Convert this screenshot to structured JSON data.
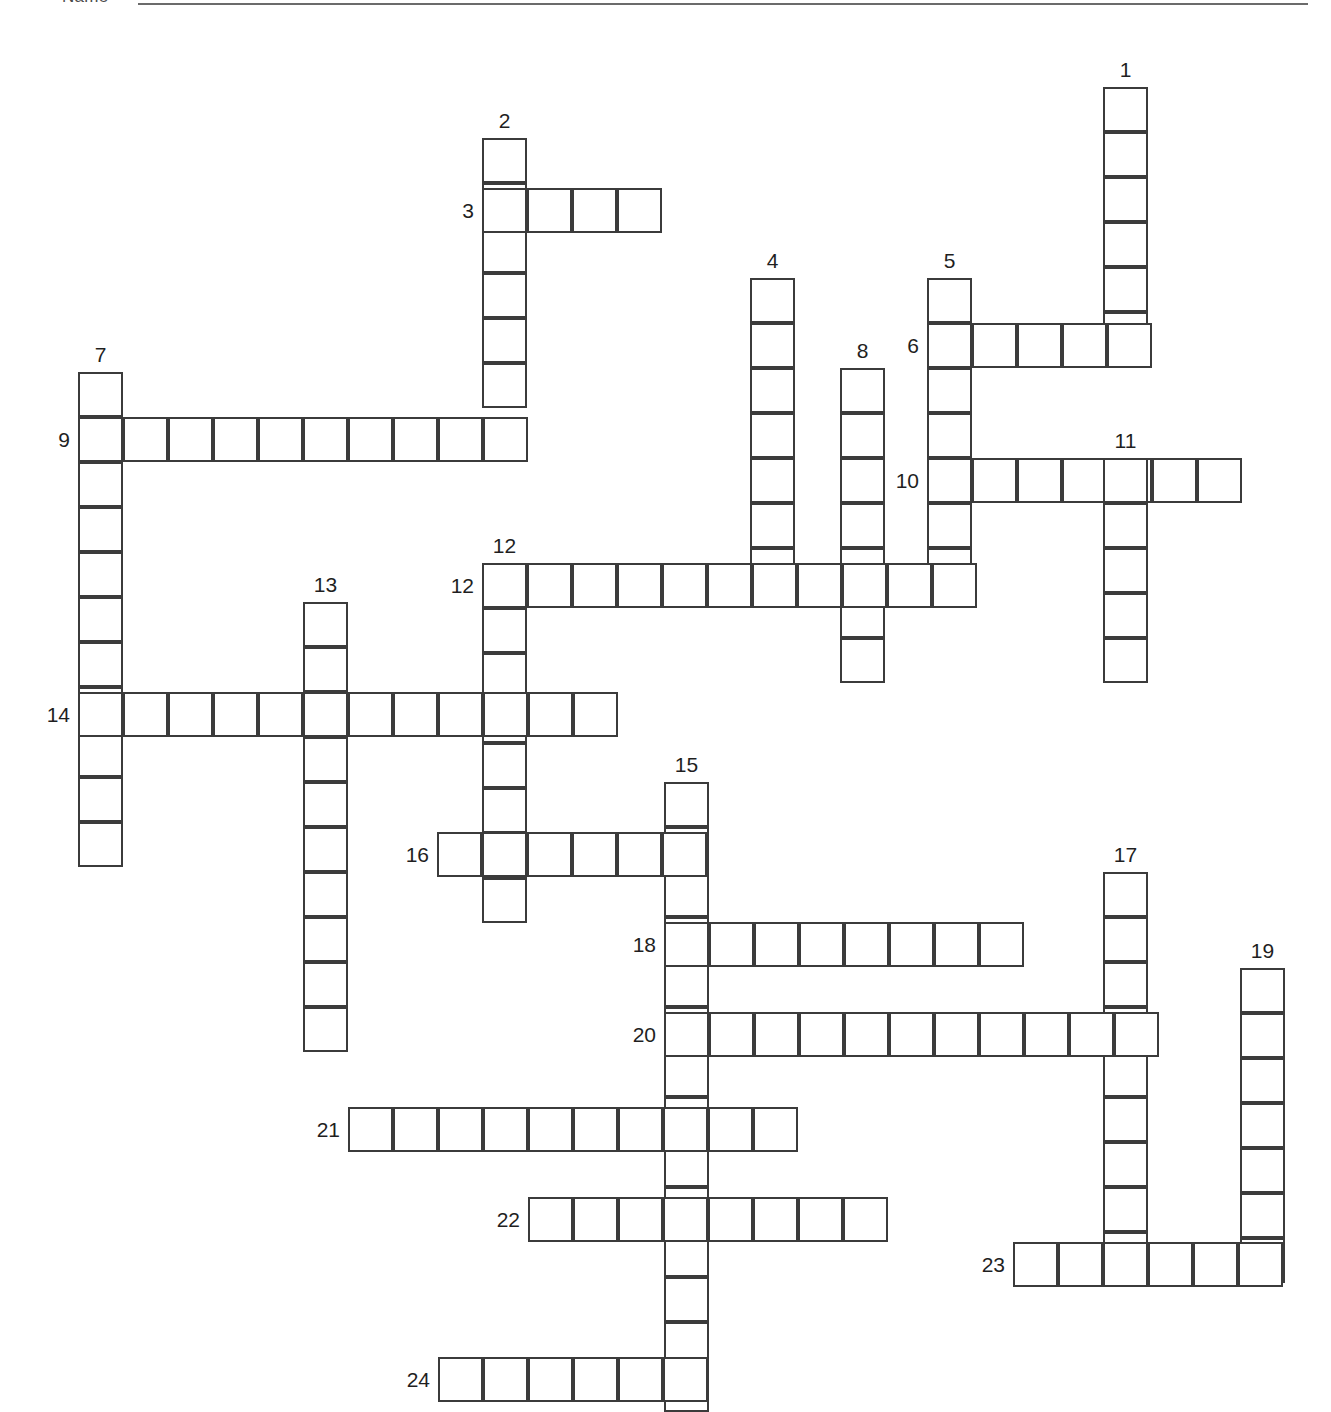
{
  "page": {
    "background_color": "#ffffff",
    "cell_size_px": 45,
    "grid_line_color": "#3b3b3b",
    "number_color": "#1f1f1f"
  },
  "header": {
    "name_label": "Name",
    "name_line": ""
  },
  "puzzle": {
    "total_entries": 24,
    "across_count": 14,
    "down_count": 10,
    "entries": [
      {
        "number": "1",
        "direction": "down",
        "length": 6,
        "col": 1103,
        "row": 87,
        "label_pos": "above"
      },
      {
        "number": "2",
        "direction": "down",
        "length": 6,
        "col": 482,
        "row": 138,
        "label_pos": "above"
      },
      {
        "number": "3",
        "direction": "across",
        "length": 4,
        "col": 482,
        "row": 188,
        "label_pos": "left"
      },
      {
        "number": "4",
        "direction": "down",
        "length": 7,
        "col": 750,
        "row": 278,
        "label_pos": "above"
      },
      {
        "number": "5",
        "direction": "down",
        "length": 7,
        "col": 927,
        "row": 278,
        "label_pos": "above"
      },
      {
        "number": "6",
        "direction": "across",
        "length": 5,
        "col": 927,
        "row": 323,
        "label_pos": "left"
      },
      {
        "number": "7",
        "direction": "down",
        "length": 11,
        "col": 78,
        "row": 372,
        "label_pos": "above"
      },
      {
        "number": "8",
        "direction": "down",
        "length": 7,
        "col": 840,
        "row": 368,
        "label_pos": "above"
      },
      {
        "number": "9",
        "direction": "across",
        "length": 10,
        "col": 78,
        "row": 417,
        "label_pos": "left"
      },
      {
        "number": "10",
        "direction": "across",
        "length": 7,
        "col": 927,
        "row": 458,
        "label_pos": "left"
      },
      {
        "number": "11",
        "direction": "down",
        "length": 5,
        "col": 1103,
        "row": 458,
        "label_pos": "above"
      },
      {
        "number": "12",
        "direction": "down",
        "length": 8,
        "col": 482,
        "row": 563,
        "label_pos": "above"
      },
      {
        "number": "12",
        "direction": "across",
        "length": 11,
        "col": 482,
        "row": 563,
        "label_pos": "left"
      },
      {
        "number": "13",
        "direction": "down",
        "length": 10,
        "col": 303,
        "row": 602,
        "label_pos": "above"
      },
      {
        "number": "14",
        "direction": "across",
        "length": 12,
        "col": 78,
        "row": 692,
        "label_pos": "left"
      },
      {
        "number": "15",
        "direction": "down",
        "length": 14,
        "col": 664,
        "row": 782,
        "label_pos": "above"
      },
      {
        "number": "16",
        "direction": "across",
        "length": 6,
        "col": 437,
        "row": 832,
        "label_pos": "left"
      },
      {
        "number": "17",
        "direction": "down",
        "length": 9,
        "col": 1103,
        "row": 872,
        "label_pos": "above"
      },
      {
        "number": "18",
        "direction": "across",
        "length": 8,
        "col": 664,
        "row": 922,
        "label_pos": "left"
      },
      {
        "number": "19",
        "direction": "down",
        "length": 7,
        "col": 1240,
        "row": 968,
        "label_pos": "above"
      },
      {
        "number": "20",
        "direction": "across",
        "length": 11,
        "col": 664,
        "row": 1012,
        "label_pos": "left"
      },
      {
        "number": "21",
        "direction": "across",
        "length": 10,
        "col": 348,
        "row": 1107,
        "label_pos": "left"
      },
      {
        "number": "22",
        "direction": "across",
        "length": 8,
        "col": 528,
        "row": 1197,
        "label_pos": "left"
      },
      {
        "number": "23",
        "direction": "across",
        "length": 6,
        "col": 1013,
        "row": 1242,
        "label_pos": "left"
      },
      {
        "number": "24",
        "direction": "across",
        "length": 6,
        "col": 438,
        "row": 1357,
        "label_pos": "left"
      }
    ]
  }
}
